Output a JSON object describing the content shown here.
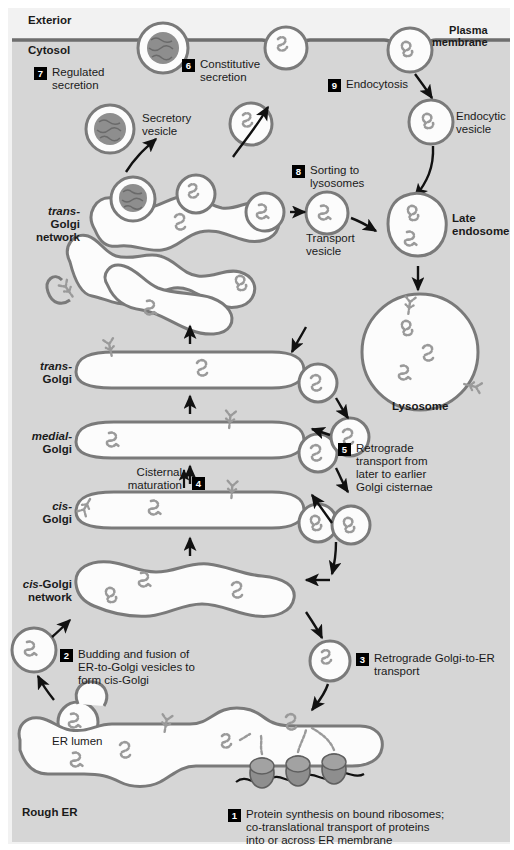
{
  "figure": {
    "background_exterior": "#f2f2f2",
    "background_cytosol": "#d6d6d6",
    "membrane_color": "#6e6e6e",
    "organelle_stroke": "#7a7a7a",
    "organelle_fill": "#fcfcfc",
    "cargo_color": "#9a9a9a",
    "ribosome_color": "#8c8c8c",
    "arrow_color": "#111111",
    "text_color": "#1a1a1a",
    "badge_bg": "#000000",
    "badge_fg": "#ffffff"
  },
  "compartments": {
    "exterior": "Exterior",
    "cytosol": "Cytosol",
    "plasma_membrane": "Plasma\nmembrane",
    "trans_golgi_network": {
      "italic": "trans-",
      "rest": "Golgi\nnetwork"
    },
    "trans_golgi": {
      "italic": "trans-",
      "rest": "Golgi"
    },
    "medial_golgi": {
      "italic": "medial-",
      "rest": "Golgi"
    },
    "cis_golgi": {
      "italic": "cis-",
      "rest": "Golgi"
    },
    "cis_golgi_network": {
      "italic": "cis-",
      "rest": "Golgi\nnetwork"
    },
    "er_lumen": "ER lumen",
    "rough_er": "Rough ER"
  },
  "structures": {
    "secretory_vesicle": "Secretory\nvesicle",
    "transport_vesicle": "Transport\nvesicle",
    "endocytic_vesicle": "Endocytic\nvesicle",
    "late_endosome": "Late\nendosome",
    "lysosome": "Lysosome"
  },
  "steps": [
    {
      "n": "1",
      "text": "Protein synthesis on bound ribosomes;\nco-translational transport of proteins\ninto or across ER membrane"
    },
    {
      "n": "2",
      "text": "Budding and fusion of\nER-to-Golgi vesicles to\nform cis-Golgi"
    },
    {
      "n": "3",
      "text": "Retrograde Golgi-to-ER\ntransport"
    },
    {
      "n": "4",
      "text": "Cisternal maturation"
    },
    {
      "n": "5",
      "text": "Retrograde\ntransport from\nlater to earlier\nGolgi cisternae"
    },
    {
      "n": "6",
      "text": "Constitutive\nsecretion"
    },
    {
      "n": "7",
      "text": "Regulated\nsecretion"
    },
    {
      "n": "8",
      "text": "Sorting to\nlysosomes"
    },
    {
      "n": "9",
      "text": "Endocytosis"
    }
  ],
  "icons": {
    "arrow": "arrow-icon",
    "vesicle": "vesicle-icon",
    "ribosome": "ribosome-icon",
    "cargo_protein": "cargo-protein-icon",
    "membrane_protein": "membrane-protein-icon"
  }
}
